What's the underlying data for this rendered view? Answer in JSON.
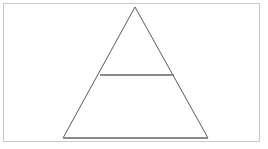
{
  "figure": {
    "background_color": "#ffffff",
    "frame": {
      "name": "figure-border",
      "stroke_color": "#c9c9c9",
      "stroke_width": 1,
      "x": 3,
      "y": 3,
      "width": 257,
      "height": 139
    },
    "shapes": [
      {
        "name": "triangle-outline",
        "type": "polygon",
        "stroke_color": "#5a5a5a",
        "stroke_width": 1,
        "fill": "none",
        "vertices": [
          {
            "label": "apex",
            "x": 135,
            "y": 7
          },
          {
            "label": "bottom-right",
            "x": 208,
            "y": 138
          },
          {
            "label": "bottom-left",
            "x": 63,
            "y": 138
          }
        ]
      },
      {
        "name": "horizontal-divider-line",
        "type": "line",
        "stroke_color": "#8a8a8a",
        "stroke_width": 1.4,
        "x1": 100,
        "y1": 75,
        "x2": 174,
        "y2": 75
      },
      {
        "name": "triangle-base-line",
        "type": "line",
        "stroke_color": "#8a8a8a",
        "stroke_width": 1.4,
        "x1": 63,
        "y1": 138,
        "x2": 208,
        "y2": 138
      }
    ]
  },
  "chart_data": {
    "type": "diagram",
    "title": "",
    "subtitle": "",
    "xlabel": "",
    "ylabel": "",
    "legend": [],
    "annotations": [],
    "elements": [
      {
        "id": "triangle",
        "kind": "isosceles-triangle",
        "apex": [
          135,
          7
        ],
        "base_left": [
          63,
          138
        ],
        "base_right": [
          208,
          138
        ],
        "base_width_px": 145,
        "height_px": 131
      },
      {
        "id": "divider",
        "kind": "horizontal-segment",
        "from": [
          100,
          75
        ],
        "to": [
          174,
          75
        ],
        "length_px": 74,
        "fraction_of_height_from_apex": 0.52
      }
    ]
  }
}
